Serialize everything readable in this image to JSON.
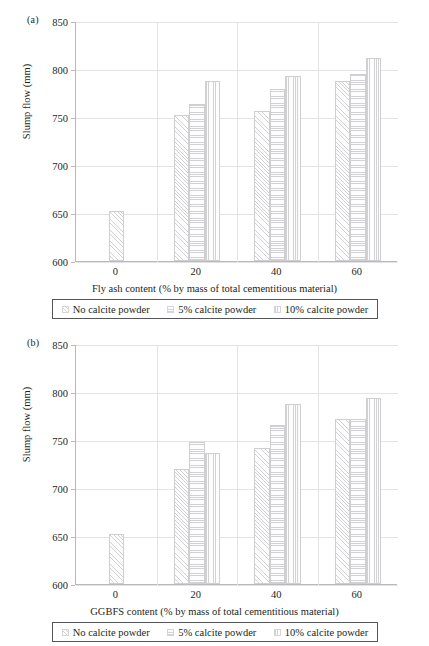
{
  "figure": {
    "panels": [
      {
        "tag": "(a)",
        "ylabel": "Slump flow (mm)",
        "xlabel": "Fly ash content (% by mass of total cementitious material)",
        "yticks": [
          "850",
          "800",
          "750",
          "700",
          "650",
          "600"
        ],
        "xticks": [
          "0",
          "20",
          "40",
          "60"
        ],
        "legend": [
          {
            "label": "No calcite powder",
            "pattern": "diagonal"
          },
          {
            "label": "5% calcite powder",
            "pattern": "horizontal"
          },
          {
            "label": "10% calcite powder",
            "pattern": "vertical"
          }
        ]
      },
      {
        "tag": "(b)",
        "ylabel": "Slump flow (mm)",
        "xlabel": "GGBFS content (% by mass of total cementitious material)",
        "yticks": [
          "850",
          "800",
          "750",
          "700",
          "650",
          "600"
        ],
        "xticks": [
          "0",
          "20",
          "40",
          "60"
        ],
        "legend": [
          {
            "label": "No calcite powder",
            "pattern": "diagonal"
          },
          {
            "label": "5% calcite powder",
            "pattern": "horizontal"
          },
          {
            "label": "10% calcite powder",
            "pattern": "vertical"
          }
        ]
      }
    ]
  },
  "chart_data": [
    {
      "type": "bar",
      "title": "(a) Slump flow vs fly ash content",
      "xlabel": "Fly ash content (% by mass of total cementitious material)",
      "ylabel": "Slump flow (mm)",
      "ylim": [
        600,
        850
      ],
      "yticks": [
        600,
        650,
        700,
        750,
        800,
        850
      ],
      "grid": true,
      "legend_position": "below",
      "categories": [
        "0",
        "20",
        "40",
        "60"
      ],
      "series": [
        {
          "name": "No calcite powder",
          "pattern": "diagonal",
          "values": [
            652,
            752,
            756,
            787
          ]
        },
        {
          "name": "5% calcite powder",
          "pattern": "horizontal",
          "values": [
            null,
            764,
            779,
            795
          ]
        },
        {
          "name": "10% calcite powder",
          "pattern": "vertical",
          "values": [
            null,
            788,
            793,
            811
          ]
        }
      ]
    },
    {
      "type": "bar",
      "title": "(b) Slump flow vs GGBFS content",
      "xlabel": "GGBFS content (% by mass of total cementitious material)",
      "ylabel": "Slump flow (mm)",
      "ylim": [
        600,
        850
      ],
      "yticks": [
        600,
        650,
        700,
        750,
        800,
        850
      ],
      "grid": true,
      "legend_position": "below",
      "categories": [
        "0",
        "20",
        "40",
        "60"
      ],
      "series": [
        {
          "name": "No calcite powder",
          "pattern": "diagonal",
          "values": [
            652,
            720,
            742,
            772
          ]
        },
        {
          "name": "5% calcite powder",
          "pattern": "horizontal",
          "values": [
            null,
            748,
            766,
            772
          ]
        },
        {
          "name": "10% calcite powder",
          "pattern": "vertical",
          "values": [
            null,
            736,
            788,
            794
          ]
        }
      ]
    }
  ]
}
